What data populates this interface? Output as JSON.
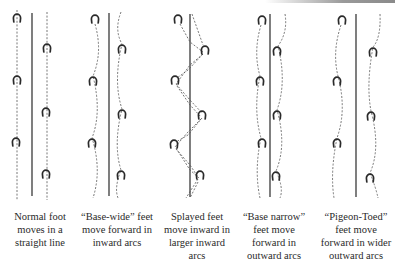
{
  "figure": {
    "colors": {
      "ink": "#2a2a2a",
      "dash": "#555555",
      "background": "#ffffff"
    }
  },
  "panels": [
    {
      "id": "normal",
      "caption_lines": [
        "Normal foot",
        "moves in a",
        "straight line"
      ],
      "center_line": {
        "x": 32,
        "y1": 13,
        "y2": 196
      },
      "left_shoes": [
        [
          17,
          18
        ],
        [
          17,
          80
        ],
        [
          16,
          142
        ]
      ],
      "right_shoes": [
        [
          47,
          48
        ],
        [
          46,
          112
        ],
        [
          46,
          174
        ]
      ],
      "left_path": "M17 10 L17 200",
      "right_path": "M47 12 L47 200"
    },
    {
      "id": "base-wide",
      "caption_lines": [
        "“Base-wide” feet",
        "move forward in",
        "inward arcs"
      ],
      "center_line": {
        "x": 109,
        "y1": 13,
        "y2": 196
      },
      "left_shoes": [
        [
          95,
          19
        ],
        [
          93,
          81
        ],
        [
          92,
          143
        ]
      ],
      "right_shoes": [
        [
          122,
          49
        ],
        [
          122,
          114
        ],
        [
          121,
          175
        ]
      ],
      "left_path": "M95 24 Q103 52 93 76 Q102 112 92 138 Q102 170 93 198",
      "right_path": "M121 12 Q114 30 122 44 Q113 82 122 109 Q113 145 121 170 Q114 188 118 198"
    },
    {
      "id": "splayed",
      "caption_lines": [
        "Splayed feet",
        "move inward in",
        "larger inward",
        "arcs"
      ],
      "center_line": {
        "x": 190,
        "y1": 14,
        "y2": 197
      },
      "left_shoes": [
        [
          178,
          19
        ],
        [
          175,
          80
        ],
        [
          174,
          144
        ]
      ],
      "right_shoes": [
        [
          205,
          50
        ],
        [
          202,
          115
        ],
        [
          200,
          175
        ]
      ],
      "left_path": "M180 24 L190 42 L203 52 M203 54 L190 65 L176 84 M177 86 L190 105 L201 117 M201 119 L188 132 L175 147 M176 149 L190 165 L198 177 M198 179 L186 198",
      "right_path": "M192 14 L203 45 M203 54 L188 70 L177 78 M176 84 L190 100 L202 113 M202 118 L188 135 L176 142 M176 148 L190 170 L199 178 M198 182 L190 198"
    },
    {
      "id": "base-narrow",
      "caption_lines": [
        "“Base narrow”",
        "feet move",
        "forward in",
        "outward arcs"
      ],
      "center_line": {
        "x": 270,
        "y1": 14,
        "y2": 197
      },
      "left_shoes": [
        [
          262,
          20
        ],
        [
          260,
          81
        ],
        [
          262,
          143
        ]
      ],
      "right_shoes": [
        [
          277,
          51
        ],
        [
          277,
          115
        ],
        [
          276,
          176
        ]
      ],
      "left_path": "M261 25 Q253 52 260 76 Q253 110 261 138 Q254 170 260 198",
      "right_path": "M285 14 Q288 32 278 46 Q287 82 277 110 Q287 145 276 171 Q284 188 280 198"
    },
    {
      "id": "pigeon-toed",
      "caption_lines": [
        "“Pigeon-Toed”",
        "feet move",
        "forward in wider",
        "outward arcs"
      ],
      "center_line": {
        "x": 356,
        "y1": 14,
        "y2": 197
      },
      "left_shoes": [
        [
          342,
          20
        ],
        [
          337,
          81
        ],
        [
          337,
          143
        ]
      ],
      "right_shoes": [
        [
          373,
          52
        ],
        [
          371,
          116
        ],
        [
          370,
          178
        ]
      ],
      "left_path": "M341 25 Q332 52 338 76 Q347 110 337 138 Q330 172 334 198",
      "right_path": "M380 14 Q381 38 373 47 Q366 85 371 111 Q381 148 370 173 Q376 188 378 198"
    }
  ]
}
